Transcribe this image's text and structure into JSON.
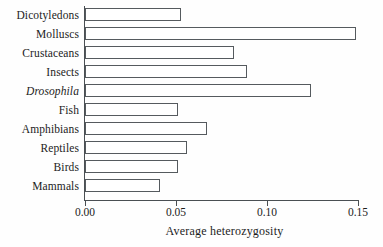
{
  "chart_data": {
    "type": "bar",
    "orientation": "horizontal",
    "title": "",
    "xlabel": "Average heterozygosity",
    "ylabel": "",
    "xlim": [
      0.0,
      0.15
    ],
    "xticks": [
      0.0,
      0.05,
      0.1,
      0.15
    ],
    "xtick_labels": [
      "0.00",
      "0.05",
      "0.10",
      "0.15"
    ],
    "grid": false,
    "legend": null,
    "categories": [
      "Dicotyledons",
      "Molluscs",
      "Crustaceans",
      "Insects",
      "Drosophila",
      "Fish",
      "Amphibians",
      "Reptiles",
      "Birds",
      "Mammals"
    ],
    "category_styles": [
      "normal",
      "normal",
      "normal",
      "normal",
      "italic",
      "normal",
      "normal",
      "normal",
      "normal",
      "normal"
    ],
    "values": [
      0.053,
      0.149,
      0.082,
      0.089,
      0.124,
      0.051,
      0.067,
      0.056,
      0.051,
      0.041
    ],
    "bar_fill_color": "#ffffff",
    "bar_edge_color": "#555a5e",
    "axis_color": "#4a4f53",
    "background_color": "#fefefe"
  }
}
